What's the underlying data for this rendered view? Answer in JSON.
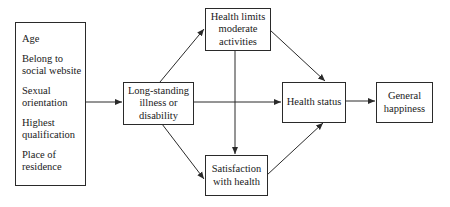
{
  "diagram": {
    "covariates_box": {
      "items": [
        {
          "line1": "Age",
          "line2": ""
        },
        {
          "line1": "Belong to",
          "line2": "social website"
        },
        {
          "line1": "Sexual",
          "line2": "orientation"
        },
        {
          "line1": "Highest",
          "line2": "qualification"
        },
        {
          "line1": "Place of",
          "line2": "residence"
        }
      ]
    },
    "nodes": {
      "illness": {
        "lines": [
          "Long-standing",
          "illness or",
          "disability"
        ]
      },
      "health_limits": {
        "lines": [
          "Health limits",
          "moderate",
          "activities"
        ]
      },
      "satisfaction": {
        "lines": [
          "Satisfaction",
          "with health"
        ]
      },
      "health_status": {
        "lines": [
          "Health status"
        ]
      },
      "happiness": {
        "lines": [
          "General",
          "happiness"
        ]
      }
    },
    "edges": [
      {
        "from": "covariates",
        "to": "illness"
      },
      {
        "from": "illness",
        "to": "health_limits"
      },
      {
        "from": "illness",
        "to": "health_status"
      },
      {
        "from": "illness",
        "to": "satisfaction"
      },
      {
        "from": "health_limits",
        "to": "health_status"
      },
      {
        "from": "health_limits",
        "to": "satisfaction"
      },
      {
        "from": "satisfaction",
        "to": "health_status"
      },
      {
        "from": "health_status",
        "to": "happiness"
      }
    ],
    "colors": {
      "line": "#2a2a2a",
      "background": "#ffffff"
    }
  }
}
